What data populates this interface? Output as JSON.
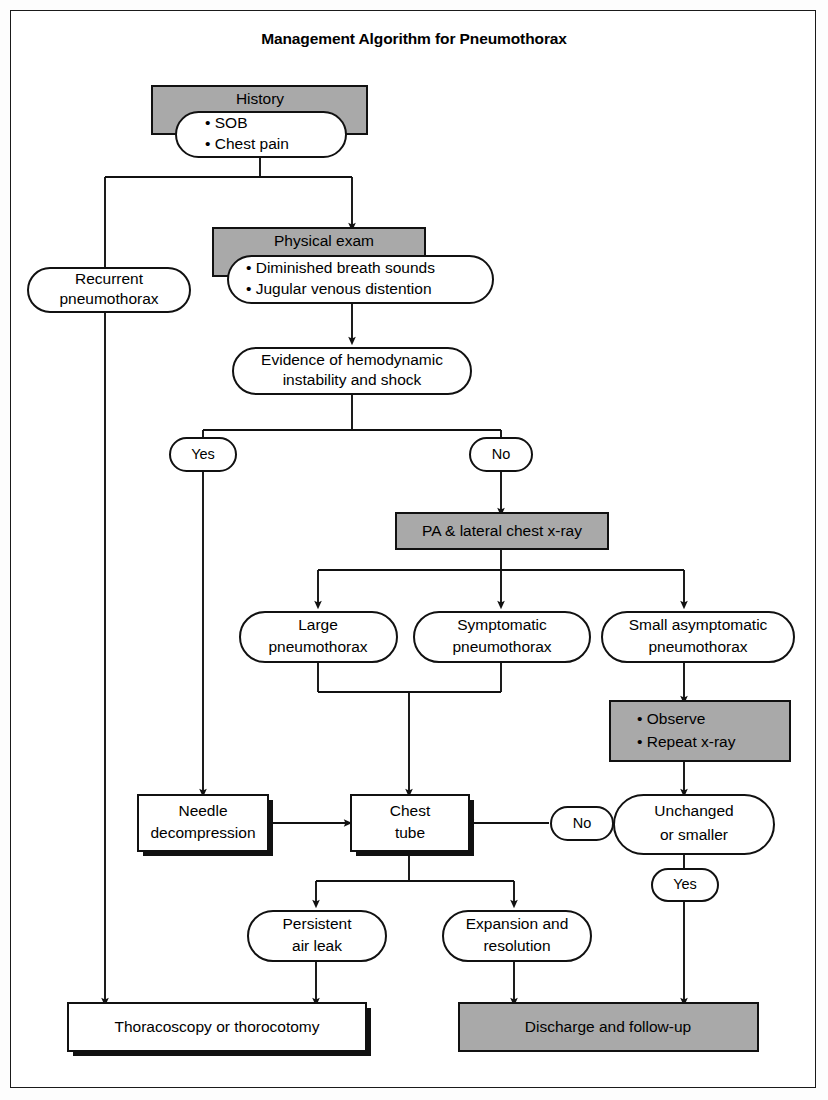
{
  "page": {
    "title": "Management Algorithm for Pneumothorax"
  },
  "colors": {
    "gray_fill": "#a9a9a9",
    "white_fill": "#ffffff",
    "line": "#111111",
    "text": "#000000"
  },
  "nodes": {
    "history_header": "History",
    "history_item_1": "• SOB",
    "history_item_2": "• Chest pain",
    "recurrent_line_1": "Recurrent",
    "recurrent_line_2": "pneumothorax",
    "physical_exam_header": "Physical exam",
    "physical_exam_item_1": "• Diminished breath sounds",
    "physical_exam_item_2": "• Jugular venous distention",
    "hemodynamic_line_1": "Evidence of hemodynamic",
    "hemodynamic_line_2": "instability and shock",
    "decision_yes_top": "Yes",
    "decision_no_top": "No",
    "xray": "PA & lateral chest x-ray",
    "large_line_1": "Large",
    "large_line_2": "pneumothorax",
    "symptomatic_line_1": "Symptomatic",
    "symptomatic_line_2": "pneumothorax",
    "small_asymptomatic_line_1": "Small asymptomatic",
    "small_asymptomatic_line_2": "pneumothorax",
    "observe_item_1": "• Observe",
    "observe_item_2": "• Repeat x-ray",
    "needle_line_1": "Needle",
    "needle_line_2": "decompression",
    "chest_tube_line_1": "Chest",
    "chest_tube_line_2": "tube",
    "decision_no_bottom": "No",
    "unchanged_line_1": "Unchanged",
    "unchanged_line_2": "or smaller",
    "decision_yes_bottom": "Yes",
    "persistent_line_1": "Persistent",
    "persistent_line_2": "air leak",
    "expansion_line_1": "Expansion and",
    "expansion_line_2": "resolution",
    "thoracoscopy": "Thoracoscopy or thorocotomy",
    "discharge": "Discharge and follow-up"
  }
}
